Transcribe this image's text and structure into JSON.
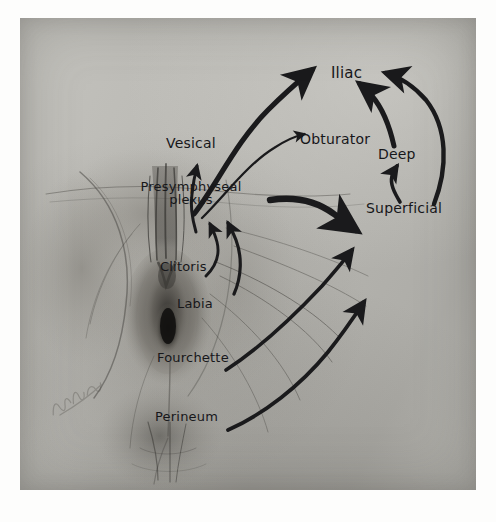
{
  "figure": {
    "kind": "anatomical-illustration-photograph",
    "medium": "pencil and wash drawing photographed on matte paper",
    "background_color": "#b7b7b2",
    "ink_color": "#1a1a1c",
    "paper_margin_color": "#fdfdfc"
  },
  "nodes": [
    {
      "id": "iliac",
      "label": "Iliac",
      "x": 331,
      "y": 58,
      "size": 15,
      "lines": 1
    },
    {
      "id": "vesical",
      "label": "Vesical",
      "x": 166,
      "y": 128,
      "size": 14,
      "lines": 1
    },
    {
      "id": "obturator",
      "label": "Obturator",
      "x": 300,
      "y": 124,
      "size": 14,
      "lines": 1
    },
    {
      "id": "deep",
      "label": "Deep",
      "x": 378,
      "y": 139,
      "size": 14,
      "lines": 1
    },
    {
      "id": "superficial",
      "label": "Superficial",
      "x": 366,
      "y": 193,
      "size": 14,
      "lines": 1
    },
    {
      "id": "presymphyseal",
      "label": "Presymphyseal\nplexus",
      "x": 141,
      "y": 172,
      "size": 13,
      "lines": 2
    },
    {
      "id": "clitoris",
      "label": "Clitoris",
      "x": 160,
      "y": 252,
      "size": 13,
      "lines": 1
    },
    {
      "id": "labia",
      "label": "Labia",
      "x": 177,
      "y": 289,
      "size": 13,
      "lines": 1
    },
    {
      "id": "fourchette",
      "label": "Fourchette",
      "x": 157,
      "y": 343,
      "size": 13,
      "lines": 1
    },
    {
      "id": "perineum",
      "label": "Perineum",
      "x": 155,
      "y": 402,
      "size": 13,
      "lines": 1
    }
  ],
  "flows": [
    {
      "from": "presymphyseal",
      "to": "iliac",
      "style": "thick-tapered-curve"
    },
    {
      "from": "deep",
      "to": "iliac",
      "style": "thick-tapered-short"
    },
    {
      "from": "superficial",
      "to": "iliac",
      "style": "long-outer-curve"
    },
    {
      "from": "presymphyseal",
      "to": "obturator",
      "style": "thin-curve"
    },
    {
      "from": "presymphyseal",
      "to": "vesical",
      "style": "short-up-arrow"
    },
    {
      "from": "presymphyseal",
      "to": "superficial",
      "style": "thick-bar-curve"
    },
    {
      "from": "superficial",
      "to": "deep",
      "style": "short-up-arrow"
    },
    {
      "from": "clitoris",
      "to": "presymphyseal",
      "style": "short-hook"
    },
    {
      "from": "labia",
      "to": "presymphyseal",
      "style": "short-hook"
    },
    {
      "from": "fourchette",
      "to": "superficial",
      "style": "rising-curve"
    },
    {
      "from": "perineum",
      "to": "superficial",
      "style": "long-rising-curve"
    }
  ],
  "signature": {
    "present": true,
    "legible": false,
    "position": "lower-left"
  }
}
